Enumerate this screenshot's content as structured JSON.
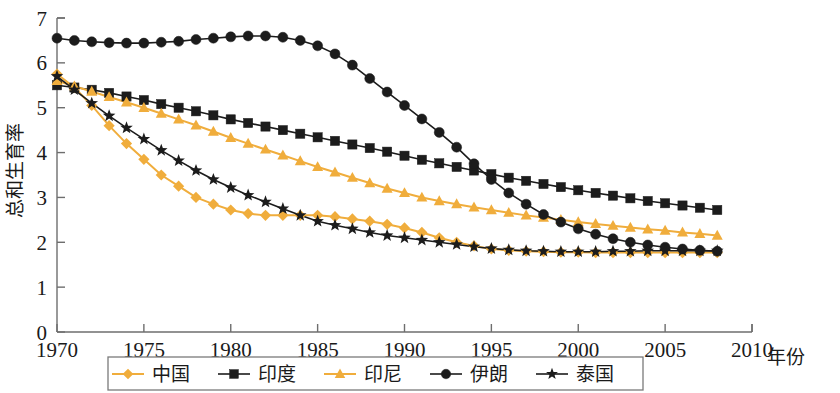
{
  "chart_data": {
    "type": "line",
    "title": "",
    "xlabel": "年份",
    "ylabel": "总和生育率",
    "xlim": [
      1970,
      2010
    ],
    "ylim": [
      0,
      7
    ],
    "xticks": [
      "1970",
      "1975",
      "1980",
      "1985",
      "1990",
      "1995",
      "2000",
      "2005",
      "2010"
    ],
    "yticks": [
      "0",
      "1",
      "2",
      "3",
      "4",
      "5",
      "6",
      "7"
    ],
    "grid": false,
    "legend_position": "bottom",
    "x": [
      1970,
      1971,
      1972,
      1973,
      1974,
      1975,
      1976,
      1977,
      1978,
      1979,
      1980,
      1981,
      1982,
      1983,
      1984,
      1985,
      1986,
      1987,
      1988,
      1989,
      1990,
      1991,
      1992,
      1993,
      1994,
      1995,
      1996,
      1997,
      1998,
      1999,
      2000,
      2001,
      2002,
      2003,
      2004,
      2005,
      2006,
      2007,
      2008
    ],
    "series": [
      {
        "name": "中国",
        "color": "#f0ad3c",
        "marker": "diamond",
        "values": [
          5.75,
          5.45,
          5.05,
          4.6,
          4.2,
          3.85,
          3.5,
          3.25,
          3.0,
          2.85,
          2.72,
          2.64,
          2.6,
          2.6,
          2.6,
          2.6,
          2.57,
          2.52,
          2.47,
          2.4,
          2.32,
          2.22,
          2.1,
          2.0,
          1.92,
          1.85,
          1.82,
          1.8,
          1.79,
          1.78,
          1.78,
          1.77,
          1.77,
          1.77,
          1.77,
          1.77,
          1.77,
          1.77,
          1.77
        ]
      },
      {
        "name": "印度",
        "color": "#1c1c1c",
        "marker": "square",
        "values": [
          5.5,
          5.45,
          5.4,
          5.33,
          5.25,
          5.17,
          5.08,
          5.0,
          4.92,
          4.83,
          4.74,
          4.66,
          4.58,
          4.5,
          4.42,
          4.34,
          4.26,
          4.18,
          4.1,
          4.02,
          3.93,
          3.84,
          3.76,
          3.68,
          3.6,
          3.52,
          3.44,
          3.37,
          3.3,
          3.23,
          3.16,
          3.1,
          3.04,
          2.98,
          2.92,
          2.87,
          2.82,
          2.77,
          2.72
        ]
      },
      {
        "name": "印尼",
        "color": "#f0ad3c",
        "marker": "triangle",
        "values": [
          5.6,
          5.48,
          5.36,
          5.24,
          5.12,
          5.0,
          4.87,
          4.74,
          4.61,
          4.47,
          4.33,
          4.2,
          4.07,
          3.94,
          3.81,
          3.68,
          3.56,
          3.44,
          3.32,
          3.2,
          3.1,
          3.0,
          2.92,
          2.85,
          2.78,
          2.72,
          2.66,
          2.6,
          2.55,
          2.5,
          2.45,
          2.41,
          2.37,
          2.33,
          2.29,
          2.26,
          2.22,
          2.19,
          2.15
        ]
      },
      {
        "name": "伊朗",
        "color": "#1c1c1c",
        "marker": "circle",
        "values": [
          6.55,
          6.5,
          6.47,
          6.45,
          6.44,
          6.44,
          6.46,
          6.48,
          6.52,
          6.55,
          6.58,
          6.6,
          6.6,
          6.57,
          6.5,
          6.38,
          6.2,
          5.95,
          5.65,
          5.35,
          5.05,
          4.75,
          4.45,
          4.12,
          3.75,
          3.4,
          3.1,
          2.85,
          2.62,
          2.45,
          2.3,
          2.18,
          2.08,
          2.0,
          1.94,
          1.89,
          1.85,
          1.82,
          1.8
        ]
      },
      {
        "name": "泰国",
        "color": "#1c1c1c",
        "marker": "star",
        "values": [
          5.7,
          5.4,
          5.1,
          4.82,
          4.55,
          4.3,
          4.05,
          3.82,
          3.6,
          3.4,
          3.22,
          3.05,
          2.9,
          2.75,
          2.6,
          2.47,
          2.38,
          2.3,
          2.22,
          2.15,
          2.1,
          2.05,
          2.0,
          1.95,
          1.9,
          1.86,
          1.83,
          1.81,
          1.8,
          1.79,
          1.79,
          1.79,
          1.8,
          1.8,
          1.81,
          1.81,
          1.81,
          1.81,
          1.81
        ]
      }
    ]
  },
  "legend": {
    "items": [
      {
        "label": "中国",
        "color": "#f0ad3c",
        "marker": "diamond"
      },
      {
        "label": "印度",
        "color": "#1c1c1c",
        "marker": "square"
      },
      {
        "label": "印尼",
        "color": "#f0ad3c",
        "marker": "triangle"
      },
      {
        "label": "伊朗",
        "color": "#1c1c1c",
        "marker": "circle"
      },
      {
        "label": "泰国",
        "color": "#1c1c1c",
        "marker": "star"
      }
    ]
  }
}
